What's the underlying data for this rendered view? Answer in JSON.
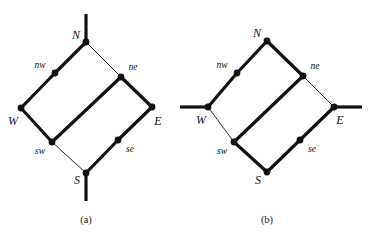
{
  "figure": {
    "width": 373,
    "height": 243,
    "background": "#ffffff",
    "ink": "#111111",
    "thick_width": 3.2,
    "thin_width": 0.9,
    "node_radius": 3.4
  },
  "panels": [
    {
      "id": "a",
      "caption": "(a)",
      "caption_pos": {
        "x": 86,
        "y": 219
      },
      "nodes": [
        {
          "id": "N",
          "label": "N",
          "x": 86,
          "y": 42,
          "label_pos": {
            "x": 76,
            "y": 35
          },
          "label_size": "cap"
        },
        {
          "id": "nw",
          "label": "nw",
          "x": 55,
          "y": 73,
          "label_pos": {
            "x": 40,
            "y": 66
          },
          "label_size": "mid"
        },
        {
          "id": "ne",
          "label": "ne",
          "x": 121,
          "y": 77,
          "label_pos": {
            "x": 133,
            "y": 68
          },
          "label_size": "mid"
        },
        {
          "id": "W",
          "label": "W",
          "x": 21,
          "y": 108,
          "label_pos": {
            "x": 13,
            "y": 121
          },
          "label_size": "cap"
        },
        {
          "id": "E",
          "label": "E",
          "x": 152,
          "y": 107,
          "label_pos": {
            "x": 158,
            "y": 121
          },
          "label_size": "cap"
        },
        {
          "id": "sw",
          "label": "sw",
          "x": 52,
          "y": 142,
          "label_pos": {
            "x": 40,
            "y": 152
          },
          "label_size": "mid"
        },
        {
          "id": "se",
          "label": "se",
          "x": 118,
          "y": 140,
          "label_pos": {
            "x": 130,
            "y": 150
          },
          "label_size": "mid"
        },
        {
          "id": "S",
          "label": "S",
          "x": 86,
          "y": 173,
          "label_pos": {
            "x": 77,
            "y": 180
          },
          "label_size": "cap"
        }
      ],
      "edges": [
        {
          "from": "N",
          "to": "nw",
          "weight": "thick"
        },
        {
          "from": "nw",
          "to": "W",
          "weight": "thick"
        },
        {
          "from": "N",
          "to": "ne",
          "weight": "thin"
        },
        {
          "from": "ne",
          "to": "E",
          "weight": "thick"
        },
        {
          "from": "W",
          "to": "sw",
          "weight": "thick"
        },
        {
          "from": "sw",
          "to": "S",
          "weight": "thin"
        },
        {
          "from": "E",
          "to": "se",
          "weight": "thick"
        },
        {
          "from": "se",
          "to": "S",
          "weight": "thick"
        },
        {
          "from": "ne",
          "to": "sw",
          "weight": "thick"
        }
      ],
      "stubs": [
        {
          "id": "north-stub",
          "from": {
            "x": 86,
            "y": 42
          },
          "to": {
            "x": 86,
            "y": 14
          },
          "weight": "thick"
        },
        {
          "id": "south-stub",
          "from": {
            "x": 86,
            "y": 173
          },
          "to": {
            "x": 86,
            "y": 201
          },
          "weight": "thick"
        }
      ]
    },
    {
      "id": "b",
      "caption": "(b)",
      "caption_pos": {
        "x": 267,
        "y": 219
      },
      "nodes": [
        {
          "id": "N",
          "label": "N",
          "x": 267,
          "y": 41,
          "label_pos": {
            "x": 257,
            "y": 33
          },
          "label_size": "cap"
        },
        {
          "id": "nw",
          "label": "nw",
          "x": 237,
          "y": 73,
          "label_pos": {
            "x": 222,
            "y": 66
          },
          "label_size": "mid"
        },
        {
          "id": "ne",
          "label": "ne",
          "x": 303,
          "y": 76,
          "label_pos": {
            "x": 315,
            "y": 67
          },
          "label_size": "mid"
        },
        {
          "id": "W",
          "label": "W",
          "x": 208,
          "y": 107,
          "label_pos": {
            "x": 201,
            "y": 120
          },
          "label_size": "cap"
        },
        {
          "id": "E",
          "label": "E",
          "x": 334,
          "y": 107,
          "label_pos": {
            "x": 340,
            "y": 120
          },
          "label_size": "cap"
        },
        {
          "id": "sw",
          "label": "sw",
          "x": 234,
          "y": 142,
          "label_pos": {
            "x": 222,
            "y": 152
          },
          "label_size": "mid"
        },
        {
          "id": "se",
          "label": "se",
          "x": 300,
          "y": 140,
          "label_pos": {
            "x": 312,
            "y": 150
          },
          "label_size": "mid"
        },
        {
          "id": "S",
          "label": "S",
          "x": 267,
          "y": 172,
          "label_pos": {
            "x": 258,
            "y": 180
          },
          "label_size": "cap"
        }
      ],
      "edges": [
        {
          "from": "N",
          "to": "nw",
          "weight": "thick"
        },
        {
          "from": "nw",
          "to": "W",
          "weight": "thick"
        },
        {
          "from": "N",
          "to": "ne",
          "weight": "thick"
        },
        {
          "from": "ne",
          "to": "E",
          "weight": "thin"
        },
        {
          "from": "W",
          "to": "sw",
          "weight": "thin"
        },
        {
          "from": "sw",
          "to": "S",
          "weight": "thick"
        },
        {
          "from": "E",
          "to": "se",
          "weight": "thick"
        },
        {
          "from": "se",
          "to": "S",
          "weight": "thick"
        },
        {
          "from": "ne",
          "to": "sw",
          "weight": "thick"
        }
      ],
      "stubs": [
        {
          "id": "west-stub",
          "from": {
            "x": 208,
            "y": 107
          },
          "to": {
            "x": 180,
            "y": 107
          },
          "weight": "thick"
        },
        {
          "id": "east-stub",
          "from": {
            "x": 334,
            "y": 107
          },
          "to": {
            "x": 362,
            "y": 107
          },
          "weight": "thick"
        }
      ]
    }
  ]
}
